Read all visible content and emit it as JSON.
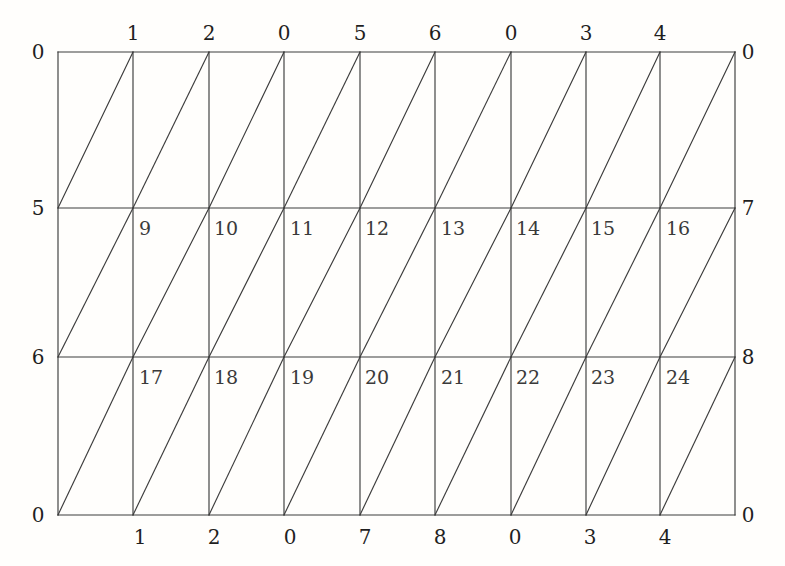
{
  "figure": {
    "background_color": "#fffefc",
    "line_color": "#3c3c3c"
  },
  "mesh": {
    "columns": 9,
    "rows": 3,
    "left": 58,
    "right": 735,
    "top": 52,
    "bottom": 515,
    "horizontal_line_y": [
      52,
      208,
      357,
      515
    ],
    "vertical_line_x": [
      58,
      133,
      209,
      284,
      360,
      435,
      511,
      586,
      660,
      735
    ],
    "diagonal_direction": "bottom-left-to-top-right"
  },
  "labels": {
    "top": [
      {
        "text": "1",
        "x": 133,
        "y": 33
      },
      {
        "text": "2",
        "x": 209,
        "y": 33
      },
      {
        "text": "0",
        "x": 284,
        "y": 33
      },
      {
        "text": "5",
        "x": 360,
        "y": 33
      },
      {
        "text": "6",
        "x": 435,
        "y": 33
      },
      {
        "text": "0",
        "x": 511,
        "y": 33
      },
      {
        "text": "3",
        "x": 586,
        "y": 33
      },
      {
        "text": "4",
        "x": 660,
        "y": 33
      }
    ],
    "bottom": [
      {
        "text": "1",
        "x": 140,
        "y": 537
      },
      {
        "text": "2",
        "x": 214,
        "y": 537
      },
      {
        "text": "0",
        "x": 290,
        "y": 537
      },
      {
        "text": "7",
        "x": 365,
        "y": 537
      },
      {
        "text": "8",
        "x": 440,
        "y": 537
      },
      {
        "text": "0",
        "x": 515,
        "y": 537
      },
      {
        "text": "3",
        "x": 590,
        "y": 537
      },
      {
        "text": "4",
        "x": 665,
        "y": 537
      }
    ],
    "left": [
      {
        "text": "0",
        "x": 38,
        "y": 52
      },
      {
        "text": "5",
        "x": 38,
        "y": 208
      },
      {
        "text": "6",
        "x": 38,
        "y": 357
      },
      {
        "text": "0",
        "x": 38,
        "y": 515
      }
    ],
    "right": [
      {
        "text": "0",
        "x": 748,
        "y": 52
      },
      {
        "text": "7",
        "x": 748,
        "y": 208
      },
      {
        "text": "8",
        "x": 748,
        "y": 357
      },
      {
        "text": "0",
        "x": 748,
        "y": 515
      }
    ],
    "interior_row_middle": [
      {
        "text": "9",
        "x": 139,
        "y": 228
      },
      {
        "text": "10",
        "x": 214,
        "y": 228
      },
      {
        "text": "11",
        "x": 290,
        "y": 228
      },
      {
        "text": "12",
        "x": 365,
        "y": 228
      },
      {
        "text": "13",
        "x": 441,
        "y": 228
      },
      {
        "text": "14",
        "x": 516,
        "y": 228
      },
      {
        "text": "15",
        "x": 591,
        "y": 228
      },
      {
        "text": "16",
        "x": 666,
        "y": 228
      }
    ],
    "interior_row_lower": [
      {
        "text": "17",
        "x": 139,
        "y": 377
      },
      {
        "text": "18",
        "x": 214,
        "y": 377
      },
      {
        "text": "19",
        "x": 290,
        "y": 377
      },
      {
        "text": "20",
        "x": 365,
        "y": 377
      },
      {
        "text": "21",
        "x": 441,
        "y": 377
      },
      {
        "text": "22",
        "x": 516,
        "y": 377
      },
      {
        "text": "23",
        "x": 591,
        "y": 377
      },
      {
        "text": "24",
        "x": 666,
        "y": 377
      }
    ]
  }
}
